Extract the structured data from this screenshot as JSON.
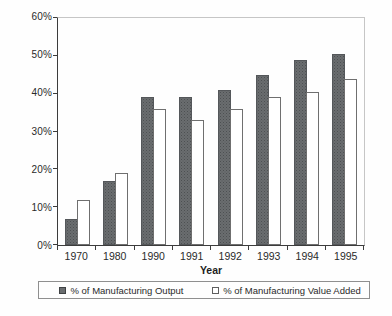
{
  "chart_data": {
    "type": "bar",
    "title": "",
    "xlabel": "Year",
    "ylabel": "",
    "categories": [
      "1970",
      "1980",
      "1990",
      "1991",
      "1992",
      "1993",
      "1994",
      "1995"
    ],
    "series": [
      {
        "name": "% of Manufacturing Output",
        "style": "dark",
        "color": "#6a6d6f",
        "values": [
          7,
          17,
          39,
          39,
          41,
          45,
          49,
          50.5
        ]
      },
      {
        "name": "% of Manufacturing Value Added",
        "style": "white",
        "color": "#ffffff",
        "values": [
          12,
          19,
          36,
          33,
          36,
          39,
          40.5,
          44
        ]
      }
    ],
    "ylim": [
      0,
      60
    ],
    "ytick_step": 10,
    "ytick_labels": [
      "0%",
      "10%",
      "20%",
      "30%",
      "40%",
      "50%",
      "60%"
    ],
    "grid": false,
    "legend_position": "bottom"
  }
}
